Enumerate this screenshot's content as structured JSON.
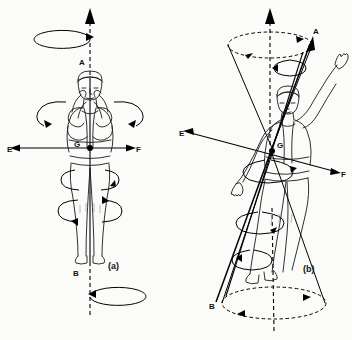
{
  "figure": {
    "background_color": "#fbfbfa",
    "line_color": "#111111",
    "panels": [
      {
        "caption": "(a)",
        "caption_x": 108,
        "caption_y": 269,
        "description": "Upright figure with hands at head, vertical longitudinal axis A-B through centre of gravity G, horizontal transverse axis E-F",
        "labels": [
          {
            "name": "axis-label-a-top",
            "text": "A",
            "x": 79,
            "y": 65
          },
          {
            "name": "axis-label-b-bottom",
            "text": "B",
            "x": 73,
            "y": 276
          },
          {
            "name": "axis-label-e-left",
            "text": "E",
            "x": 7,
            "y": 152
          },
          {
            "name": "axis-label-f-right",
            "text": "F",
            "x": 136,
            "y": 152
          },
          {
            "name": "centre-of-gravity-label",
            "text": "G",
            "x": 74,
            "y": 147
          }
        ]
      },
      {
        "caption": "(b)",
        "caption_x": 303,
        "caption_y": 272,
        "description": "Figure with one arm raised, tilted longitudinal axis A-B through centre of gravity G sweeping two precession cones, tilted transverse axis E-F",
        "labels": [
          {
            "name": "axis-label-a-top",
            "text": "A",
            "x": 313,
            "y": 34
          },
          {
            "name": "axis-label-b-bottom",
            "text": "B",
            "x": 212,
            "y": 309
          },
          {
            "name": "axis-label-e-left",
            "text": "E",
            "x": 180,
            "y": 136
          },
          {
            "name": "axis-label-f-right",
            "text": "F",
            "x": 340,
            "y": 175
          },
          {
            "name": "centre-of-gravity-label",
            "text": "G",
            "x": 275,
            "y": 150
          }
        ]
      }
    ],
    "legend_keys": {
      "A": "upper end of longitudinal axis",
      "B": "lower end of longitudinal axis",
      "E": "left end of transverse axis",
      "F": "right end of transverse axis",
      "G": "centre of gravity"
    }
  }
}
